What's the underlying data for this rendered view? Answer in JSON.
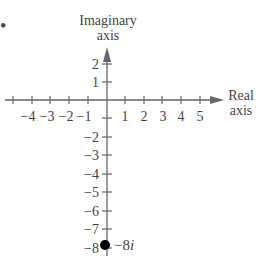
{
  "diagram": {
    "type": "complex-plane",
    "bullet_marker": "•",
    "imaginary_axis": {
      "label_line1": "Imaginary",
      "label_line2": "axis"
    },
    "real_axis": {
      "label_line1": "Real",
      "label_line2": "axis"
    },
    "real_ticks": [
      "−4",
      "−3",
      "−2",
      "−1",
      "1",
      "2",
      "3",
      "4",
      "5"
    ],
    "imag_ticks_positive": [
      "2",
      "1"
    ],
    "imag_ticks_negative": [
      "−2",
      "−3",
      "−4",
      "−5",
      "−6",
      "−7",
      "−8"
    ],
    "point": {
      "real": 0,
      "imag": -8,
      "label": "−8i",
      "label_prefix": "−8",
      "label_i": "i"
    },
    "colors": {
      "axis": "#666666",
      "point": "#000000",
      "text": "#444444"
    }
  }
}
